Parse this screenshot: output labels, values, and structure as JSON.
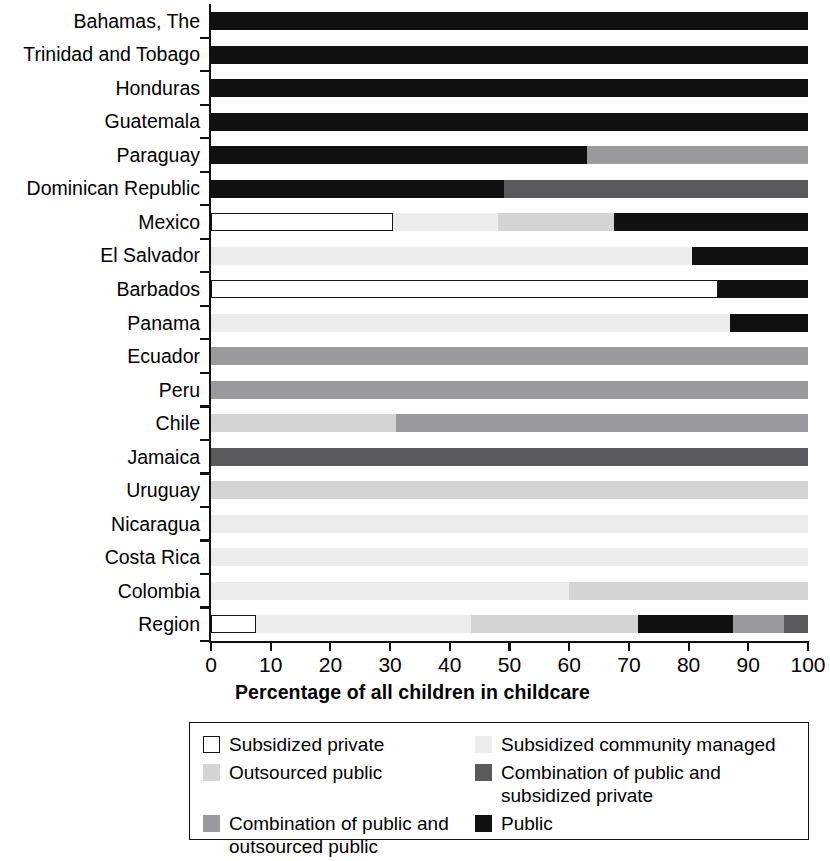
{
  "chart_data": {
    "type": "bar",
    "subtype": "horizontal-stacked-bar",
    "title": "",
    "xlabel": "Percentage of all children in childcare",
    "ylabel": "",
    "xlim": [
      0,
      100
    ],
    "xticks": [
      "0",
      "10",
      "20",
      "30",
      "40",
      "50",
      "60",
      "70",
      "80",
      "90",
      "100"
    ],
    "grid": false,
    "legend_position": "below-plot",
    "categories": [
      "Bahamas, The",
      "Trinidad and Tobago",
      "Honduras",
      "Guatemala",
      "Paraguay",
      "Dominican Republic",
      "Mexico",
      "El Salvador",
      "Barbados",
      "Panama",
      "Ecuador",
      "Peru",
      "Chile",
      "Jamaica",
      "Uruguay",
      "Nicaragua",
      "Costa Rica",
      "Colombia",
      "Region"
    ],
    "series": [
      {
        "name": "Subsidized private",
        "color": "#ffffff",
        "values": [
          0,
          0,
          0,
          0,
          0,
          0,
          30.5,
          0,
          85,
          0,
          0,
          0,
          0,
          0,
          0,
          0,
          0,
          0,
          7.5
        ]
      },
      {
        "name": "Subsidized community managed",
        "color": "#ececed",
        "values": [
          0,
          0,
          0,
          0,
          0,
          0,
          17.5,
          80.5,
          0,
          87,
          0,
          0,
          0,
          0,
          0,
          100,
          100,
          60,
          36
        ]
      },
      {
        "name": "Outsourced public",
        "color": "#d4d4d5",
        "values": [
          0,
          0,
          0,
          0,
          0,
          0,
          19.5,
          0,
          0,
          0,
          0,
          0,
          31,
          0,
          100,
          0,
          0,
          40,
          28
        ]
      },
      {
        "name": "Combination of public and subsidized private",
        "color": "#5a5a5c",
        "values": [
          0,
          0,
          0,
          0,
          0,
          51,
          0,
          0,
          0,
          0,
          0,
          0,
          0,
          100,
          0,
          0,
          0,
          0,
          4
        ]
      },
      {
        "name": "Combination of public and outsourced public",
        "color": "#9a9a9c",
        "values": [
          0,
          0,
          0,
          0,
          37,
          0,
          0,
          0,
          0,
          0,
          100,
          100,
          69,
          0,
          0,
          0,
          0,
          0,
          8.5
        ]
      },
      {
        "name": "Public",
        "color": "#101010",
        "values": [
          100,
          100,
          100,
          100,
          63,
          49,
          32.5,
          19.5,
          15,
          13,
          0,
          0,
          0,
          0,
          0,
          0,
          0,
          0,
          16
        ]
      }
    ],
    "stack_order": [
      [
        "Subsidized private",
        "Subsidized community managed",
        "Outsourced public",
        "Combination of public and subsidized private",
        "Combination of public and outsourced public",
        "Public"
      ]
    ],
    "bars": [
      {
        "label": "Bahamas, The",
        "segments": [
          {
            "series": "Public",
            "start": 0,
            "end": 100
          }
        ]
      },
      {
        "label": "Trinidad and Tobago",
        "segments": [
          {
            "series": "Public",
            "start": 0,
            "end": 100
          }
        ]
      },
      {
        "label": "Honduras",
        "segments": [
          {
            "series": "Public",
            "start": 0,
            "end": 100
          }
        ]
      },
      {
        "label": "Guatemala",
        "segments": [
          {
            "series": "Public",
            "start": 0,
            "end": 100
          }
        ]
      },
      {
        "label": "Paraguay",
        "segments": [
          {
            "series": "Public",
            "start": 0,
            "end": 63
          },
          {
            "series": "Combination of public and outsourced public",
            "start": 63,
            "end": 100
          }
        ]
      },
      {
        "label": "Dominican Republic",
        "segments": [
          {
            "series": "Public",
            "start": 0,
            "end": 49
          },
          {
            "series": "Combination of public and subsidized private",
            "start": 49,
            "end": 100
          }
        ]
      },
      {
        "label": "Mexico",
        "segments": [
          {
            "series": "Subsidized private",
            "start": 0,
            "end": 30.5
          },
          {
            "series": "Subsidized community managed",
            "start": 30.5,
            "end": 48
          },
          {
            "series": "Outsourced public",
            "start": 48,
            "end": 67.5
          },
          {
            "series": "Public",
            "start": 67.5,
            "end": 100
          }
        ]
      },
      {
        "label": "El Salvador",
        "segments": [
          {
            "series": "Subsidized community managed",
            "start": 0,
            "end": 80.5
          },
          {
            "series": "Public",
            "start": 80.5,
            "end": 100
          }
        ]
      },
      {
        "label": "Barbados",
        "segments": [
          {
            "series": "Subsidized private",
            "start": 0,
            "end": 85
          },
          {
            "series": "Public",
            "start": 85,
            "end": 100
          }
        ]
      },
      {
        "label": "Panama",
        "segments": [
          {
            "series": "Subsidized community managed",
            "start": 0,
            "end": 87
          },
          {
            "series": "Public",
            "start": 87,
            "end": 100
          }
        ]
      },
      {
        "label": "Ecuador",
        "segments": [
          {
            "series": "Combination of public and outsourced public",
            "start": 0,
            "end": 100
          }
        ]
      },
      {
        "label": "Peru",
        "segments": [
          {
            "series": "Combination of public and outsourced public",
            "start": 0,
            "end": 100
          }
        ]
      },
      {
        "label": "Chile",
        "segments": [
          {
            "series": "Outsourced public",
            "start": 0,
            "end": 31
          },
          {
            "series": "Combination of public and outsourced public",
            "start": 31,
            "end": 100
          }
        ]
      },
      {
        "label": "Jamaica",
        "segments": [
          {
            "series": "Combination of public and subsidized private",
            "start": 0,
            "end": 100
          }
        ]
      },
      {
        "label": "Uruguay",
        "segments": [
          {
            "series": "Outsourced public",
            "start": 0,
            "end": 100
          }
        ]
      },
      {
        "label": "Nicaragua",
        "segments": [
          {
            "series": "Subsidized community managed",
            "start": 0,
            "end": 100
          }
        ]
      },
      {
        "label": "Costa Rica",
        "segments": [
          {
            "series": "Subsidized community managed",
            "start": 0,
            "end": 100
          }
        ]
      },
      {
        "label": "Colombia",
        "segments": [
          {
            "series": "Subsidized community managed",
            "start": 0,
            "end": 60
          },
          {
            "series": "Outsourced public",
            "start": 60,
            "end": 100
          }
        ]
      },
      {
        "label": "Region",
        "segments": [
          {
            "series": "Subsidized private",
            "start": 0,
            "end": 7.5
          },
          {
            "series": "Subsidized community managed",
            "start": 7.5,
            "end": 43.5
          },
          {
            "series": "Outsourced public",
            "start": 43.5,
            "end": 71.5
          },
          {
            "series": "Public",
            "start": 71.5,
            "end": 87.5
          },
          {
            "series": "Combination of public and outsourced public",
            "start": 87.5,
            "end": 96
          },
          {
            "series": "Combination of public and subsidized private",
            "start": 96,
            "end": 100
          }
        ]
      }
    ]
  },
  "legend": {
    "items": [
      {
        "label": "Subsidized private",
        "color": "#ffffff",
        "outlined": true,
        "column": 0
      },
      {
        "label": "Subsidized community managed",
        "color": "#ececed",
        "outlined": false,
        "column": 1
      },
      {
        "label": "Outsourced public",
        "color": "#d4d4d5",
        "outlined": false,
        "column": 0
      },
      {
        "label": "Combination of public and\nsubsidized private",
        "color": "#5a5a5c",
        "outlined": false,
        "column": 1
      },
      {
        "label": "Combination of public and\noutsourced public",
        "color": "#9a9a9c",
        "outlined": false,
        "column": 0
      },
      {
        "label": "Public",
        "color": "#101010",
        "outlined": false,
        "column": 1
      }
    ]
  }
}
